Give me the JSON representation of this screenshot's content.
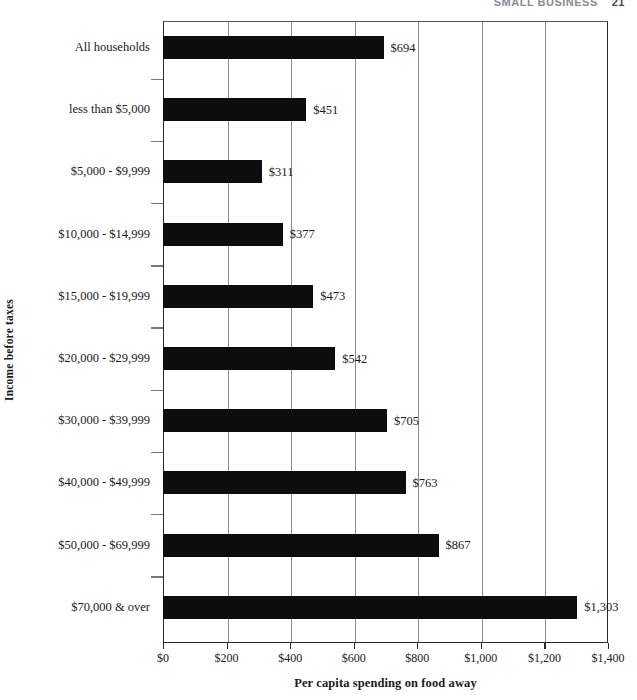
{
  "page_header": {
    "text": "SMALL BUSINESS",
    "page_number": "21"
  },
  "chart_data": {
    "type": "bar",
    "orientation": "horizontal",
    "title": "",
    "xlabel": "Per capita spending on food away",
    "ylabel": "Income before taxes",
    "categories": [
      "All households",
      "less than $5,000",
      "$5,000 - $9,999",
      "$10,000 - $14,999",
      "$15,000 - $19,999",
      "$20,000 - $29,999",
      "$30,000 - $39,999",
      "$40,000 - $49,999",
      "$50,000 - $69,999",
      "$70,000 & over"
    ],
    "values": [
      694,
      451,
      311,
      377,
      473,
      542,
      705,
      763,
      867,
      1303
    ],
    "value_labels": [
      "$694",
      "$451",
      "$311",
      "$377",
      "$473",
      "$542",
      "$705",
      "$763",
      "$867",
      "$1,303"
    ],
    "xlim": [
      0,
      1400
    ],
    "xticks": [
      0,
      200,
      400,
      600,
      800,
      1000,
      1200,
      1400
    ],
    "xtick_labels": [
      "$0",
      "$200",
      "$400",
      "$600",
      "$800",
      "$1,000",
      "$1,200",
      "$1,400"
    ],
    "grid": "vertical",
    "legend": "none",
    "bar_color": "#0d0d0d",
    "gridline_color": "#8d8d8d",
    "axis_color": "#2a2a2a"
  }
}
